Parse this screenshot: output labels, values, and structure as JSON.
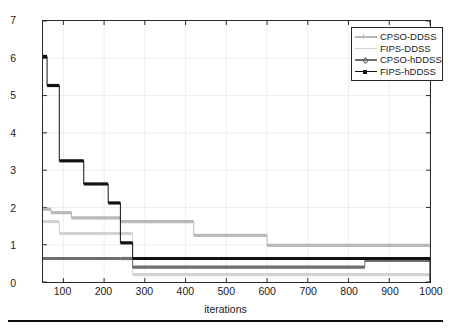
{
  "figure": {
    "background": "#ffffff",
    "bottom_rule_color": "#111111"
  },
  "axes": {
    "xlabel": "iterations",
    "ylabel": "Delay",
    "xticks": [
      "100",
      "200",
      "300",
      "400",
      "500",
      "600",
      "700",
      "800",
      "900",
      "1000"
    ],
    "yticks": [
      "0",
      "1",
      "2",
      "3",
      "4",
      "5",
      "6",
      "7"
    ],
    "xlim": [
      50,
      1000
    ],
    "ylim": [
      0,
      7
    ],
    "grid": true,
    "grid_color": "#e9e9e9",
    "frame_color": "#2a2a2a"
  },
  "legend": {
    "position": "top-right",
    "border_color": "#262626",
    "items": [
      {
        "label": "CPSO-DDSS",
        "color": "#b9b9b9",
        "marker": "plus"
      },
      {
        "label": "FIPS-DDSS",
        "color": "#d2d2d2",
        "marker": "none"
      },
      {
        "label": "CPSO-hDDSS",
        "color": "#6e6e6e",
        "marker": "diamond"
      },
      {
        "label": "FIPS-hDDSS",
        "color": "#111111",
        "marker": "square"
      }
    ]
  },
  "chart_data": {
    "type": "line",
    "title": "",
    "xlabel": "iterations",
    "ylabel": "Delay",
    "xlim": [
      50,
      1000
    ],
    "ylim": [
      0,
      7
    ],
    "grid": true,
    "legend_position": "top-right",
    "x_ticks": [
      100,
      200,
      300,
      400,
      500,
      600,
      700,
      800,
      900,
      1000
    ],
    "y_ticks": [
      0,
      1,
      2,
      3,
      4,
      5,
      6,
      7
    ],
    "step_style": "post",
    "series": [
      {
        "name": "CPSO-DDSS",
        "color": "#b9b9b9",
        "marker": "plus",
        "x": [
          50,
          70,
          120,
          240,
          420,
          600,
          1000
        ],
        "y": [
          1.95,
          1.86,
          1.72,
          1.62,
          1.25,
          0.98,
          0.98
        ]
      },
      {
        "name": "FIPS-DDSS",
        "color": "#d2d2d2",
        "marker": "none",
        "x": [
          50,
          90,
          240,
          270,
          480,
          840,
          1000
        ],
        "y": [
          1.62,
          1.3,
          1.3,
          0.2,
          0.2,
          0.2,
          0.07
        ]
      },
      {
        "name": "CPSO-hDDSS",
        "color": "#6e6e6e",
        "marker": "diamond",
        "x": [
          50,
          240,
          270,
          600,
          840,
          1000
        ],
        "y": [
          0.63,
          0.63,
          0.4,
          0.4,
          0.58,
          0.58
        ]
      },
      {
        "name": "FIPS-hDDSS",
        "color": "#111111",
        "marker": "square",
        "x": [
          50,
          60,
          90,
          150,
          210,
          240,
          270,
          480,
          1000
        ],
        "y": [
          6.05,
          5.27,
          3.25,
          2.63,
          2.12,
          1.05,
          0.63,
          0.63,
          0.06
        ]
      }
    ]
  }
}
